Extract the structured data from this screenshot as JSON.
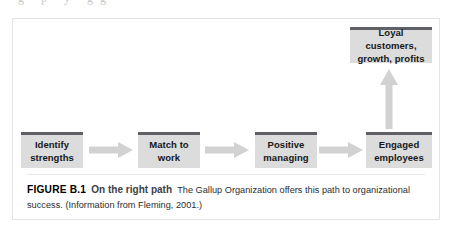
{
  "page": {
    "bleed_text": "g p y gg",
    "background_color": "#ffffff",
    "frame_border_color": "#e3e3e3"
  },
  "figure": {
    "label": "FIGURE B.1",
    "title": "On the right path",
    "description": "The Gallup Organization offers this path to organizational success.",
    "source": "(Information from Fleming, 2001.)",
    "colors": {
      "node_fill": "#dcdcdc",
      "node_top_bar": "#5f6166",
      "arrow_fill": "#d2d2d2",
      "text": "#15171a"
    }
  },
  "diagram": {
    "type": "flow",
    "nodes": [
      {
        "id": "identify-strengths",
        "line1": "Identify",
        "line2": "strengths"
      },
      {
        "id": "match-to-work",
        "line1": "Match to",
        "line2": "work"
      },
      {
        "id": "positive-managing",
        "line1": "Positive",
        "line2": "managing"
      },
      {
        "id": "engaged-employees",
        "line1": "Engaged",
        "line2": "employees"
      },
      {
        "id": "loyal-customers",
        "line1": "Loyal customers,",
        "line2": "growth, profits"
      }
    ],
    "connections": [
      {
        "from": "identify-strengths",
        "to": "match-to-work",
        "direction": "right"
      },
      {
        "from": "match-to-work",
        "to": "positive-managing",
        "direction": "right"
      },
      {
        "from": "positive-managing",
        "to": "engaged-employees",
        "direction": "right"
      },
      {
        "from": "engaged-employees",
        "to": "loyal-customers",
        "direction": "up"
      }
    ]
  }
}
